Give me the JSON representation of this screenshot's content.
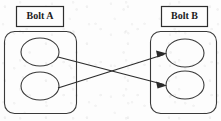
{
  "diagram": {
    "background_color": "#fdfdfd",
    "stroke_color": "#2b2b2b",
    "groups": [
      {
        "id": "bolt-a",
        "label": "Bolt A",
        "label_box": {
          "x": 16,
          "y": 6,
          "width": 47,
          "height": 20
        },
        "container": {
          "x": 4,
          "y": 31,
          "width": 72,
          "height": 82,
          "radius": 10
        },
        "nodes": [
          {
            "id": "bolt-a-node-1",
            "cx": 40,
            "cy": 52,
            "rx": 19,
            "ry": 14
          },
          {
            "id": "bolt-a-node-2",
            "cx": 40,
            "cy": 86,
            "rx": 19,
            "ry": 14
          }
        ]
      },
      {
        "id": "bolt-b",
        "label": "Bolt B",
        "label_box": {
          "x": 161,
          "y": 6,
          "width": 46,
          "height": 20
        },
        "container": {
          "x": 150,
          "y": 31,
          "width": 66,
          "height": 82,
          "radius": 10
        },
        "nodes": [
          {
            "id": "bolt-b-node-1",
            "cx": 185,
            "cy": 53,
            "rx": 19,
            "ry": 14
          },
          {
            "id": "bolt-b-node-2",
            "cx": 185,
            "cy": 85,
            "rx": 19,
            "ry": 14
          }
        ]
      }
    ],
    "connections": [
      {
        "id": "edge-a1-to-b2",
        "from": "bolt-a-node-1",
        "to": "bolt-b-node-2",
        "x1": 58,
        "y1": 57,
        "x2": 166,
        "y2": 85,
        "arrow": "end"
      },
      {
        "id": "edge-a2-to-b1",
        "from": "bolt-a-node-2",
        "to": "bolt-b-node-1",
        "x1": 58,
        "y1": 88,
        "x2": 166,
        "y2": 54,
        "arrow": "end"
      }
    ]
  }
}
